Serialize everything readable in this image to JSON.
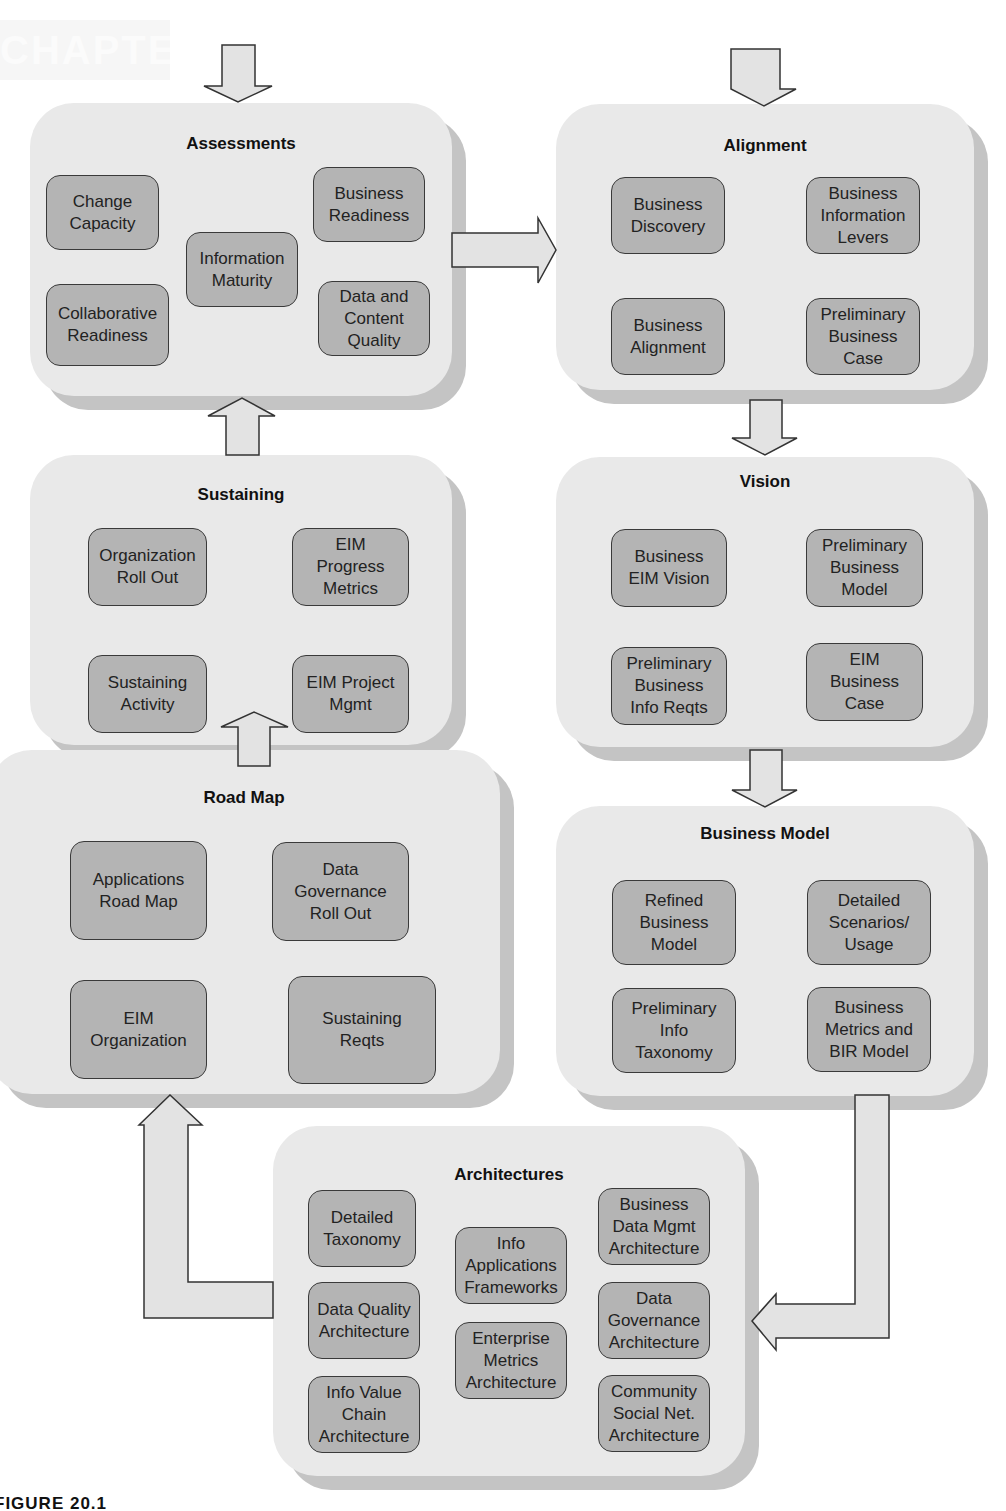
{
  "figure": {
    "caption": "FIGURE 20.1",
    "watermark": "CHAPTER"
  },
  "colors": {
    "panel_fill": "#e9e9e9",
    "panel_shadow": "#c4c4c4",
    "box_fill": "#b4b4b4",
    "box_border": "#3a3a3a",
    "arrow_fill": "#e3e3e3"
  },
  "panels": {
    "assessments": {
      "title": "Assessments",
      "items": [
        "Change\nCapacity",
        "Business\nReadiness",
        "Information\nMaturity",
        "Collaborative\nReadiness",
        "Data and\nContent\nQuality"
      ]
    },
    "alignment": {
      "title": "Alignment",
      "items": [
        "Business\nDiscovery",
        "Business\nInformation\nLevers",
        "Business\nAlignment",
        "Preliminary\nBusiness\nCase"
      ]
    },
    "sustaining": {
      "title": "Sustaining",
      "items": [
        "Organization\nRoll Out",
        "EIM\nProgress\nMetrics",
        "Sustaining\nActivity",
        "EIM Project\nMgmt"
      ]
    },
    "vision": {
      "title": "Vision",
      "items": [
        "Business\nEIM Vision",
        "Preliminary\nBusiness\nModel",
        "Preliminary\nBusiness\nInfo Reqts",
        "EIM\nBusiness\nCase"
      ]
    },
    "road_map": {
      "title": "Road Map",
      "items": [
        "Applications\nRoad Map",
        "Data\nGovernance\nRoll Out",
        "EIM\nOrganization",
        "Sustaining\nReqts"
      ]
    },
    "business_model": {
      "title": "Business Model",
      "items": [
        "Refined\nBusiness\nModel",
        "Detailed\nScenarios/\nUsage",
        "Preliminary\nInfo\nTaxonomy",
        "Business\nMetrics and\nBIR Model"
      ]
    },
    "architectures": {
      "title": "Architectures",
      "items": [
        "Detailed\nTaxonomy",
        "Info\nApplications\nFrameworks",
        "Business\nData Mgmt\nArchitecture",
        "Data Quality\nArchitecture",
        "Enterprise\nMetrics\nArchitecture",
        "Data\nGovernance\nArchitecture",
        "Info Value\nChain\nArchitecture",
        "Community\nSocial Net.\nArchitecture"
      ]
    }
  },
  "flow": [
    {
      "from": "entry",
      "to": "Assessments"
    },
    {
      "from": "entry",
      "to": "Alignment"
    },
    {
      "from": "Assessments",
      "to": "Alignment"
    },
    {
      "from": "Alignment",
      "to": "Vision"
    },
    {
      "from": "Vision",
      "to": "Business Model"
    },
    {
      "from": "Business Model",
      "to": "Architectures"
    },
    {
      "from": "Architectures",
      "to": "Road Map"
    },
    {
      "from": "Road Map",
      "to": "Sustaining"
    },
    {
      "from": "Sustaining",
      "to": "Assessments"
    }
  ]
}
